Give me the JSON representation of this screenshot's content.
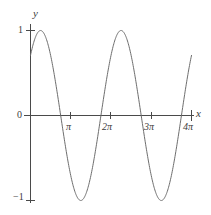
{
  "chart_data": {
    "type": "line",
    "title": "",
    "subtitle": "",
    "xlabel": "x",
    "ylabel": "y",
    "function": "y = cos(x - pi/4)",
    "xlim": [
      0,
      12.566
    ],
    "ylim": [
      -1,
      1
    ],
    "grid": false,
    "legend": null,
    "x_tick_labels": [
      "π",
      "2π",
      "3π",
      "4π"
    ],
    "x_tick_values": [
      3.1416,
      6.2832,
      9.4248,
      12.5664
    ],
    "y_tick_labels": [
      "1",
      "0",
      "−1"
    ],
    "y_tick_values": [
      1,
      0,
      -1
    ],
    "amplitude": 1,
    "period": 6.2832,
    "phase_shift": 0.7854,
    "x": [
      0,
      0.393,
      0.785,
      1.178,
      1.571,
      1.963,
      2.356,
      2.749,
      3.142,
      3.534,
      3.927,
      4.32,
      4.712,
      5.105,
      5.498,
      5.89,
      6.283,
      6.676,
      7.069,
      7.461,
      7.854,
      8.247,
      8.639,
      9.032,
      9.425,
      9.817,
      10.21,
      10.603,
      10.996,
      11.388,
      11.781,
      12.174,
      12.566
    ],
    "y": [
      0.707,
      0.924,
      1.0,
      0.924,
      0.707,
      0.383,
      0.0,
      -0.383,
      -0.707,
      -0.924,
      -1.0,
      -0.924,
      -0.707,
      -0.383,
      0.0,
      0.383,
      0.707,
      0.924,
      1.0,
      0.924,
      0.707,
      0.383,
      0.0,
      -0.383,
      -0.707,
      -0.924,
      -1.0,
      -0.924,
      -0.707,
      -0.383,
      0.0,
      0.383,
      0.707
    ],
    "zero_crossings": [
      2.356,
      5.498,
      8.639,
      11.781
    ],
    "maxima_x": [
      0.785,
      7.069
    ],
    "minima_x": [
      3.927,
      10.21
    ],
    "colors": {
      "curve": "#6e6e6e",
      "axis": "#4a4a4a",
      "text": "#3c3c3c",
      "background": "#ffffff"
    }
  },
  "labels": {
    "y_axis": "y",
    "x_axis": "x",
    "y_one": "1",
    "y_zero": "0",
    "y_minus_one": "−1",
    "x_pi": "π",
    "x_2pi": "2π",
    "x_3pi": "3π",
    "x_4pi": "4π"
  }
}
